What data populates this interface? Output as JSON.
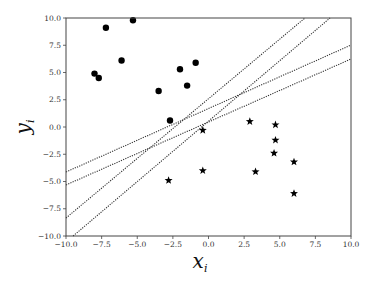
{
  "chart_data": {
    "type": "scatter",
    "title": "",
    "xlabel": "x_i",
    "ylabel": "y_i",
    "xlim": [
      -10,
      10
    ],
    "ylim": [
      -10,
      10
    ],
    "grid": false,
    "legend": null,
    "xticks": [
      -10.0,
      -7.5,
      -5.0,
      -2.5,
      0.0,
      2.5,
      5.0,
      7.5,
      10.0
    ],
    "xtick_labels": [
      "−10.0",
      "−7.5",
      "−5.0",
      "−2.5",
      "0.0",
      "2.5",
      "5.0",
      "7.5",
      "10.0"
    ],
    "yticks": [
      -10.0,
      -7.5,
      -5.0,
      -2.5,
      0.0,
      2.5,
      5.0,
      7.5,
      10.0
    ],
    "ytick_labels": [
      "−10.0",
      "−7.5",
      "−5.0",
      "−2.5",
      "0.0",
      "2.5",
      "5.0",
      "7.5",
      "10.0"
    ],
    "series": [
      {
        "name": "class +1",
        "marker": "circle",
        "color": "#000000",
        "points": [
          [
            -5.3,
            9.8
          ],
          [
            -7.2,
            9.1
          ],
          [
            -6.1,
            6.1
          ],
          [
            -8.0,
            4.9
          ],
          [
            -7.7,
            4.5
          ],
          [
            -0.9,
            5.9
          ],
          [
            -2.0,
            5.3
          ],
          [
            -1.5,
            3.8
          ],
          [
            -3.5,
            3.3
          ],
          [
            -2.7,
            0.6
          ]
        ]
      },
      {
        "name": "class -1",
        "marker": "star",
        "color": "#000000",
        "points": [
          [
            -0.4,
            -0.3
          ],
          [
            -0.4,
            -4.0
          ],
          [
            -2.8,
            -4.9
          ],
          [
            2.9,
            0.5
          ],
          [
            4.7,
            0.2
          ],
          [
            4.7,
            -1.2
          ],
          [
            4.6,
            -2.4
          ],
          [
            6.0,
            -3.2
          ],
          [
            3.3,
            -4.1
          ],
          [
            6.0,
            -6.1
          ]
        ]
      }
    ],
    "lines": [
      {
        "name": "separator-1",
        "style": "dotted",
        "from": [
          -10,
          -4.13
        ],
        "to": [
          10,
          7.52
        ]
      },
      {
        "name": "separator-2",
        "style": "dotted",
        "from": [
          -10,
          -5.32
        ],
        "to": [
          10,
          6.24
        ]
      },
      {
        "name": "separator-3",
        "style": "dotted",
        "from": [
          -10,
          -8.35
        ],
        "to": [
          6.77,
          10
        ]
      },
      {
        "name": "separator-4",
        "style": "dotted",
        "from": [
          -9.5,
          -10
        ],
        "to": [
          8.53,
          10
        ]
      }
    ]
  },
  "labels": {
    "x_main": "x",
    "x_sub": "i",
    "y_main": "y",
    "y_sub": "i"
  }
}
